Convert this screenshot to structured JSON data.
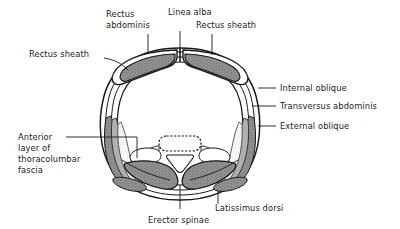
{
  "figure": {
    "type": "anatomical-cross-section",
    "background_color": "#ffffff",
    "ink_color": "#1a1a1a",
    "muscle_fill": "#8c8c8c",
    "fascia_fill": "#ffffff",
    "bone_fill": "#fcfcfc"
  },
  "labels": {
    "rectus_abdominis": {
      "line1": "Rectus",
      "line2": "abdominis"
    },
    "linea_alba": {
      "line1": "Linea alba"
    },
    "rectus_sheath_right": {
      "line1": "Rectus sheath"
    },
    "rectus_sheath_left": {
      "line1": "Rectus sheath"
    },
    "internal_oblique": {
      "line1": "Internal oblique"
    },
    "transversus_abdominis": {
      "line1": "Transversus abdominis"
    },
    "external_oblique": {
      "line1": "External oblique"
    },
    "thoracolumbar_fascia": {
      "line1": "Anterior",
      "line2": "layer of",
      "line3": "thoracolumbar",
      "line4": "fascia"
    },
    "latissimus_dorsi": {
      "line1": "Latissimus dorsi"
    },
    "erector_spinae": {
      "line1": "Erector spinae"
    }
  },
  "structures": [
    {
      "name": "rectus-abdominis-left",
      "kind": "muscle"
    },
    {
      "name": "rectus-abdominis-right",
      "kind": "muscle"
    },
    {
      "name": "linea-alba",
      "kind": "fascia"
    },
    {
      "name": "rectus-sheath-left",
      "kind": "fascia"
    },
    {
      "name": "rectus-sheath-right",
      "kind": "fascia"
    },
    {
      "name": "external-oblique-left",
      "kind": "muscle"
    },
    {
      "name": "external-oblique-right",
      "kind": "muscle"
    },
    {
      "name": "internal-oblique-left",
      "kind": "muscle"
    },
    {
      "name": "internal-oblique-right",
      "kind": "muscle"
    },
    {
      "name": "transversus-abdominis-left",
      "kind": "muscle"
    },
    {
      "name": "transversus-abdominis-right",
      "kind": "muscle"
    },
    {
      "name": "erector-spinae-left",
      "kind": "muscle"
    },
    {
      "name": "erector-spinae-right",
      "kind": "muscle"
    },
    {
      "name": "latissimus-dorsi-left",
      "kind": "muscle"
    },
    {
      "name": "latissimus-dorsi-right",
      "kind": "muscle"
    },
    {
      "name": "psoas-major-left",
      "kind": "muscle"
    },
    {
      "name": "psoas-major-right",
      "kind": "muscle"
    },
    {
      "name": "vertebral-body",
      "kind": "bone"
    },
    {
      "name": "spinous-process",
      "kind": "bone"
    },
    {
      "name": "thoracolumbar-fascia-layer",
      "kind": "fascia"
    }
  ]
}
